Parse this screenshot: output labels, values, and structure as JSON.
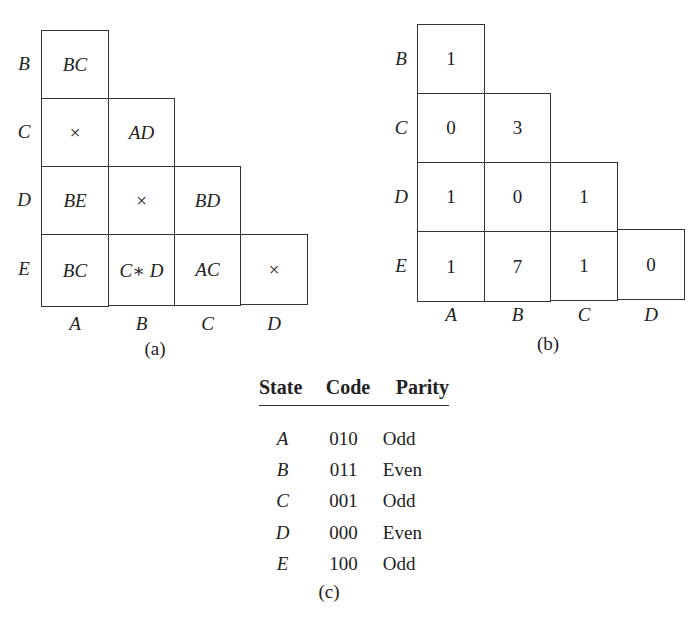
{
  "figure_a": {
    "caption": "(a)",
    "row_labels": [
      "B",
      "C",
      "D",
      "E"
    ],
    "col_labels": [
      "A",
      "B",
      "C",
      "D"
    ],
    "rows": [
      [
        "BC"
      ],
      [
        "×",
        "AD"
      ],
      [
        "BE",
        "×",
        "BD"
      ],
      [
        "BC",
        "C∗ D",
        "AC",
        "×"
      ]
    ]
  },
  "figure_b": {
    "caption": "(b)",
    "row_labels": [
      "B",
      "C",
      "D",
      "E"
    ],
    "col_labels": [
      "A",
      "B",
      "C",
      "D"
    ],
    "rows": [
      [
        "1"
      ],
      [
        "0",
        "3"
      ],
      [
        "1",
        "0",
        "1"
      ],
      [
        "1",
        "7",
        "1",
        "0"
      ]
    ]
  },
  "figure_c": {
    "caption": "(c)",
    "headers": [
      "State",
      "Code",
      "Parity"
    ],
    "rows": [
      [
        "A",
        "010",
        "Odd"
      ],
      [
        "B",
        "011",
        "Even"
      ],
      [
        "C",
        "001",
        "Odd"
      ],
      [
        "D",
        "000",
        "Even"
      ],
      [
        "E",
        "100",
        "Odd"
      ]
    ]
  }
}
